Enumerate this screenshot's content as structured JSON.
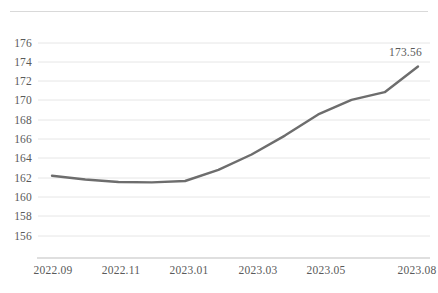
{
  "chart_data": {
    "type": "line",
    "title": "",
    "subtitle": "",
    "xlabel": "",
    "ylabel": "",
    "grid": true,
    "legend": false,
    "legend_position": "none",
    "ylim": [
      154.8,
      177.2
    ],
    "yticks": [
      176,
      174,
      172,
      170,
      168,
      166,
      164,
      162,
      160,
      158,
      156
    ],
    "ytick_labels": [
      "176",
      "174",
      "172",
      "170",
      "168",
      "166",
      "164",
      "162",
      "160",
      "158",
      "156"
    ],
    "xtick_labels": [
      "2022.09",
      "2022.11",
      "2023.01",
      "2023.03",
      "2023.05",
      "2023.08"
    ],
    "x": [
      "2022.09",
      "2022.10",
      "2022.11",
      "2022.12",
      "2023.01",
      "2023.02",
      "2023.03",
      "2023.04",
      "2023.05",
      "2023.06",
      "2023.07",
      "2023.08"
    ],
    "values": [
      162.25,
      161.85,
      161.6,
      161.55,
      161.7,
      162.85,
      164.45,
      166.4,
      168.6,
      170.1,
      170.9,
      173.56
    ],
    "series": [
      {
        "name": "series-1",
        "color": "#6d6d6d",
        "values": [
          162.25,
          161.85,
          161.6,
          161.55,
          161.7,
          162.85,
          164.45,
          166.4,
          168.6,
          170.1,
          170.9,
          173.56
        ]
      }
    ],
    "annotations": [
      {
        "name": "endpoint-value-label",
        "text": "173.56",
        "x": "2023.08",
        "y": 173.56
      }
    ],
    "colors": {
      "line": "#6d6d6d",
      "gridline": "#e6e6e6",
      "axis": "#bfbfbf",
      "tick_text": "#5a5a5a",
      "top_rule": "#d9d9d9",
      "background": "#ffffff"
    }
  }
}
